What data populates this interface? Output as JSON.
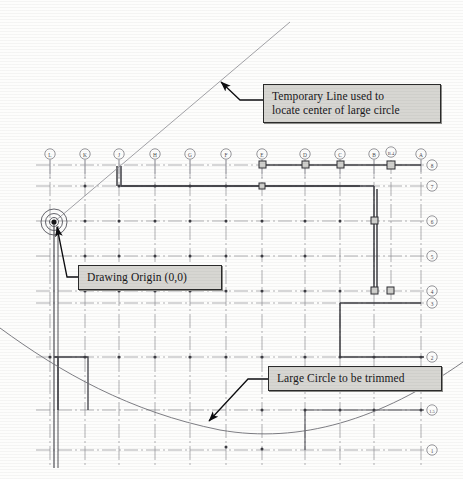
{
  "document": {
    "title": "Architectural Column Grid Plan with Construction Geometry",
    "type": "CAD floor plan / column grid layout"
  },
  "callouts": [
    {
      "id": "temporary-line",
      "text": "Temporary Line used to\nlocate center of large circle",
      "box": {
        "x": 263,
        "y": 84,
        "w": 160
      },
      "leader": {
        "from_x": 263,
        "from_y": 99,
        "elbow_x": 239,
        "elbow_y": 99,
        "tip_x": 219,
        "tip_y": 80
      }
    },
    {
      "id": "drawing-origin",
      "text": "Drawing Origin (0,0)",
      "box": {
        "x": 78,
        "y": 265,
        "w": 126
      },
      "leader": {
        "from_x": 78,
        "from_y": 276,
        "elbow_x": 68,
        "elbow_y": 276,
        "tip_x": 54,
        "tip_y": 222
      }
    },
    {
      "id": "large-circle",
      "text": "Large Circle to be trimmed",
      "box": {
        "x": 268,
        "y": 366,
        "w": 156
      },
      "leader": {
        "from_x": 268,
        "from_y": 378,
        "elbow_x": 247,
        "elbow_y": 378,
        "tip_x": 206,
        "tip_y": 424
      }
    }
  ],
  "grid": {
    "column_bubbles": [
      {
        "label": "L",
        "x": 50,
        "y": 154
      },
      {
        "label": "K",
        "x": 85,
        "y": 154
      },
      {
        "label": "J",
        "x": 119,
        "y": 154
      },
      {
        "label": "H",
        "x": 155,
        "y": 154
      },
      {
        "label": "G",
        "x": 190,
        "y": 154
      },
      {
        "label": "F",
        "x": 226,
        "y": 154
      },
      {
        "label": "E",
        "x": 262,
        "y": 154
      },
      {
        "label": "D",
        "x": 305,
        "y": 154
      },
      {
        "label": "C",
        "x": 340,
        "y": 154
      },
      {
        "label": "B",
        "x": 374,
        "y": 154
      },
      {
        "label": "B.4",
        "x": 391,
        "y": 152
      },
      {
        "label": "A",
        "x": 421,
        "y": 154
      }
    ],
    "row_bubbles": [
      {
        "label": "8",
        "x": 432,
        "y": 165
      },
      {
        "label": "7",
        "x": 432,
        "y": 186
      },
      {
        "label": "6",
        "x": 432,
        "y": 221
      },
      {
        "label": "5",
        "x": 432,
        "y": 256
      },
      {
        "label": "4",
        "x": 432,
        "y": 291
      },
      {
        "label": "3",
        "x": 432,
        "y": 303
      },
      {
        "label": "2",
        "x": 432,
        "y": 357
      },
      {
        "label": "1.5",
        "x": 432,
        "y": 410
      },
      {
        "label": "1",
        "x": 432,
        "y": 450
      }
    ],
    "column_x": [
      50,
      85,
      119,
      155,
      190,
      226,
      262,
      305,
      340,
      374,
      421
    ],
    "row_y": [
      165,
      186,
      221,
      256,
      291,
      357,
      410,
      450
    ],
    "grid_line_top": 160,
    "grid_line_bottom": 468,
    "grid_line_left": 36,
    "grid_line_right": 424
  },
  "geometry": {
    "origin": {
      "x": 54,
      "y": 222,
      "label": "0,0"
    },
    "origin_circles": [
      4,
      8,
      13
    ],
    "temporary_line": {
      "x1": 54,
      "y1": 222,
      "x2": 290,
      "y2": 22
    },
    "large_circle_arc": {
      "description": "Large circle passing through lower plan, to be trimmed",
      "points": "2,330 40,352 80,376 120,398 160,416 200,428 240,436 280,438 320,434 360,424 400,406 440,382 461,366"
    }
  },
  "colors": {
    "page_background": "#fdfdfc",
    "grid_line": "#8d8d92",
    "heavy_line": "#3a3a3e",
    "callout_fill": "#d7d6d2",
    "callout_border": "#2b2b2b",
    "text": "#17171a",
    "bubble_stroke": "#7d7d84",
    "arc_stroke": "#6f6f76"
  }
}
